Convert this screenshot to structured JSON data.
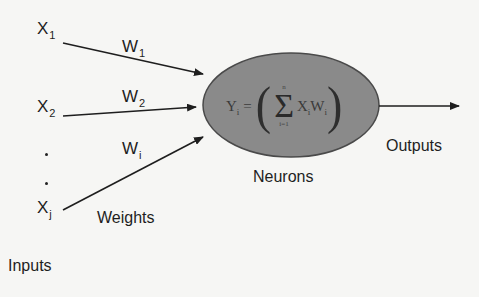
{
  "diagram": {
    "type": "single-neuron perceptron",
    "inputs": [
      {
        "symbol": "X",
        "subscript": "1",
        "weight_symbol": "W",
        "weight_subscript": "1"
      },
      {
        "symbol": "X",
        "subscript": "2",
        "weight_symbol": "W",
        "weight_subscript": "2"
      },
      {
        "symbol": "X",
        "subscript": "j",
        "weight_symbol": "W",
        "weight_subscript": "i"
      }
    ],
    "ellipsis": ".",
    "neuron": {
      "formula": {
        "lhs": "Y",
        "lhs_subscript": "i",
        "equals": "=",
        "open_paren": "(",
        "sigma": "Σ",
        "upper_limit": "n",
        "lower_limit": "i=1",
        "term": "X",
        "term_subscript": "i",
        "term2": "W",
        "term2_subscript": "i",
        "close_paren": ")"
      },
      "fill_color": "#8a8a8a",
      "stroke_color": "#4a4a4a"
    },
    "labels": {
      "inputs": "Inputs",
      "weights": "Weights",
      "neurons": "Neurons",
      "outputs": "Outputs"
    },
    "arrow_color": "#1e1e1e",
    "background": "#f6f6f4"
  }
}
